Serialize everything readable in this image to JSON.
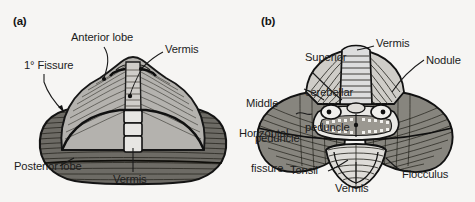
{
  "figure": {
    "background_color": "#f6f5f3",
    "ink_color": "#1c1c1c",
    "anterior_lobe_fill": "#b4b2ae",
    "posterior_lobe_fill": "#6e6b66",
    "style": "grayscale anatomical engraving"
  },
  "panels": [
    {
      "id": "a",
      "id_label": "(a)",
      "view": "superior view of cerebellum",
      "labels": [
        {
          "name": "anterior-lobe",
          "text": "Anterior lobe",
          "lines": [
            "Anterior lobe"
          ]
        },
        {
          "name": "vermis-top",
          "text": "Vermis",
          "lines": [
            "Vermis"
          ]
        },
        {
          "name": "primary-fissure",
          "text": "1° Fissure",
          "lines": [
            "1° Fissure"
          ]
        },
        {
          "name": "posterior-lobe",
          "text": "Posterior lobe",
          "lines": [
            "Posterior lobe"
          ]
        },
        {
          "name": "vermis-bottom",
          "text": "Vermis",
          "lines": [
            "Vermis"
          ]
        }
      ]
    },
    {
      "id": "b",
      "id_label": "(b)",
      "view": "inferior view of cerebellum",
      "labels": [
        {
          "name": "superior-cerebellar-peduncle",
          "text": "Superior cerebellar peduncle",
          "lines": [
            "Superior",
            "cerebellar",
            "peduncle"
          ]
        },
        {
          "name": "vermis-top",
          "text": "Vermis",
          "lines": [
            "Vermis"
          ]
        },
        {
          "name": "nodule",
          "text": "Nodule",
          "lines": [
            "Nodule"
          ]
        },
        {
          "name": "middle-peduncle",
          "text": "Middle peduncle",
          "lines": [
            "Middle",
            "peduncle"
          ]
        },
        {
          "name": "horizontal-fissure",
          "text": "Horizontal fissure",
          "lines": [
            "Horizontal",
            "fissure"
          ]
        },
        {
          "name": "tonsil",
          "text": "Tonsil",
          "lines": [
            "Tonsil"
          ]
        },
        {
          "name": "vermis-bottom",
          "text": "Vermis",
          "lines": [
            "Vermis"
          ]
        },
        {
          "name": "flocculus",
          "text": "Flocculus",
          "lines": [
            "Flocculus"
          ]
        }
      ]
    }
  ]
}
